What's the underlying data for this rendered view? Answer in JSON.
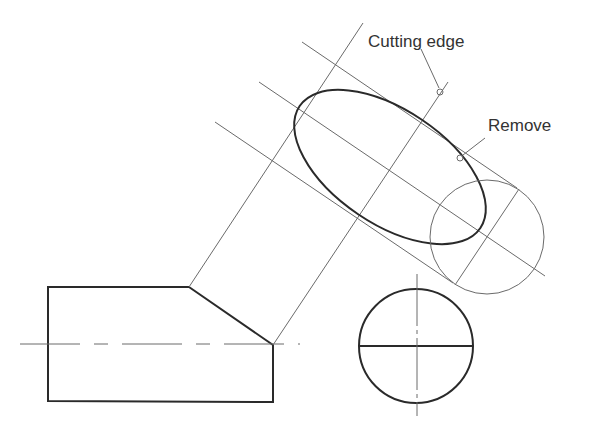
{
  "figure": {
    "type": "engineering-drawing",
    "labels": {
      "cutting_edge": "Cutting edge",
      "remove": "Remove"
    },
    "colors": {
      "thin_line": "#6a6a6a",
      "thick_line": "#2a2a2a",
      "text": "#333333",
      "background": "#ffffff"
    }
  }
}
